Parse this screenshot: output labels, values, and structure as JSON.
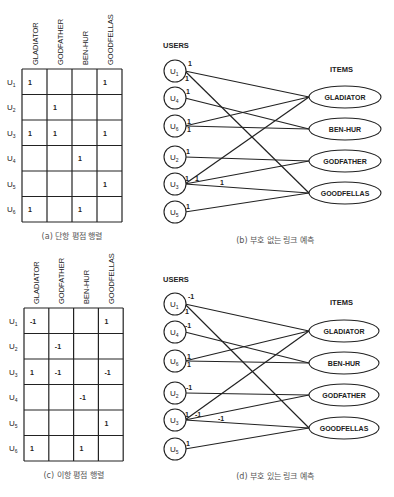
{
  "panels": {
    "a": {
      "caption": "(a) 단항 평점 행렬",
      "columns": [
        "GLADIATOR",
        "GODFATHER",
        "BEN-HUR",
        "GOODFELLAS"
      ],
      "rows": [
        {
          "user": "U",
          "sub": "1",
          "values": [
            "1",
            "",
            "",
            "1"
          ]
        },
        {
          "user": "U",
          "sub": "2",
          "values": [
            "",
            "1",
            "",
            ""
          ]
        },
        {
          "user": "U",
          "sub": "3",
          "values": [
            "1",
            "1",
            "",
            "1"
          ]
        },
        {
          "user": "U",
          "sub": "4",
          "values": [
            "",
            "",
            "1",
            ""
          ]
        },
        {
          "user": "U",
          "sub": "5",
          "values": [
            "",
            "",
            "",
            "1"
          ]
        },
        {
          "user": "U",
          "sub": "6",
          "values": [
            "1",
            "",
            "1",
            ""
          ]
        }
      ]
    },
    "b": {
      "caption": "(b) 부호 없는 링크 예측",
      "users_label": "USERS",
      "items_label": "ITEMS",
      "users": [
        "U1",
        "U4",
        "U6",
        "U2",
        "U3",
        "U5"
      ],
      "items": [
        "GLADIATOR",
        "BEN-HUR",
        "GODFATHER",
        "GOODFELLAS"
      ],
      "edges": [
        {
          "from": "U1",
          "to": "GLADIATOR",
          "label": "1"
        },
        {
          "from": "U1",
          "to": "GOODFELLAS",
          "label": "1"
        },
        {
          "from": "U4",
          "to": "BEN-HUR",
          "label": "1"
        },
        {
          "from": "U6",
          "to": "GLADIATOR",
          "label": "1"
        },
        {
          "from": "U6",
          "to": "BEN-HUR",
          "label": "1"
        },
        {
          "from": "U2",
          "to": "GODFATHER",
          "label": "1"
        },
        {
          "from": "U3",
          "to": "GLADIATOR",
          "label": "1"
        },
        {
          "from": "U3",
          "to": "GODFATHER",
          "label": "1"
        },
        {
          "from": "U3",
          "to": "GOODFELLAS",
          "label": "1"
        },
        {
          "from": "U5",
          "to": "GOODFELLAS",
          "label": "1"
        }
      ]
    },
    "c": {
      "caption": "(c) 이항 평점 행렬",
      "columns": [
        "GLADIATOR",
        "GODFATHER",
        "BEN-HUR",
        "GOODFELLAS"
      ],
      "rows": [
        {
          "user": "U",
          "sub": "1",
          "values": [
            "-1",
            "",
            "",
            "1"
          ]
        },
        {
          "user": "U",
          "sub": "2",
          "values": [
            "",
            "-1",
            "",
            ""
          ]
        },
        {
          "user": "U",
          "sub": "3",
          "values": [
            "1",
            "-1",
            "",
            "-1"
          ]
        },
        {
          "user": "U",
          "sub": "4",
          "values": [
            "",
            "",
            "-1",
            ""
          ]
        },
        {
          "user": "U",
          "sub": "5",
          "values": [
            "",
            "",
            "",
            "1"
          ]
        },
        {
          "user": "U",
          "sub": "6",
          "values": [
            "1",
            "",
            "1",
            ""
          ]
        }
      ]
    },
    "d": {
      "caption": "(d) 부호 있는 링크 예측",
      "users_label": "USERS",
      "items_label": "ITEMS",
      "users": [
        "U1",
        "U4",
        "U6",
        "U2",
        "U3",
        "U5"
      ],
      "items": [
        "GLADIATOR",
        "BEN-HUR",
        "GODFATHER",
        "GOODFELLAS"
      ],
      "edges": [
        {
          "from": "U1",
          "to": "GLADIATOR",
          "label": "-1"
        },
        {
          "from": "U1",
          "to": "GOODFELLAS",
          "label": "1"
        },
        {
          "from": "U4",
          "to": "BEN-HUR",
          "label": "-1"
        },
        {
          "from": "U6",
          "to": "GLADIATOR",
          "label": "1"
        },
        {
          "from": "U6",
          "to": "BEN-HUR",
          "label": "1"
        },
        {
          "from": "U2",
          "to": "GODFATHER",
          "label": "-1"
        },
        {
          "from": "U3",
          "to": "GLADIATOR",
          "label": "1"
        },
        {
          "from": "U3",
          "to": "GODFATHER",
          "label": "-1"
        },
        {
          "from": "U3",
          "to": "GOODFELLAS",
          "label": "-1"
        },
        {
          "from": "U5",
          "to": "GOODFELLAS",
          "label": "1"
        }
      ]
    }
  }
}
